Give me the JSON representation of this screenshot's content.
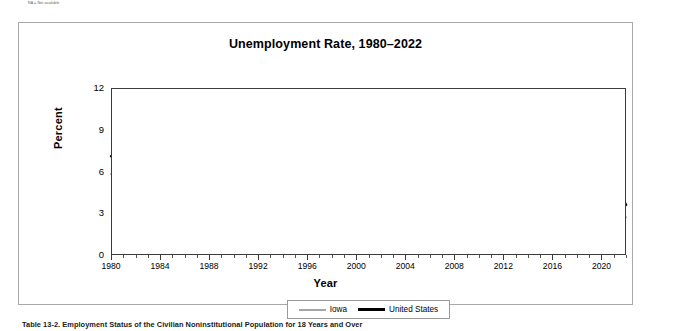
{
  "page": {
    "top_note": "NA = Not available",
    "caption": "Table 13-2.  Employment Status of the Civilian Noninstitutional Population for 18 Years and Over"
  },
  "legend": {
    "position": "bottom-center",
    "items": [
      {
        "label": "Iowa",
        "color": "#a6a6a6"
      },
      {
        "label": "United States",
        "color": "#000000"
      }
    ]
  },
  "chart_data": {
    "type": "line",
    "title": "Unemployment Rate, 1980–2022",
    "xlabel": "Year",
    "ylabel": "Percent",
    "ylim": [
      0,
      12
    ],
    "yticks": [
      0,
      3,
      6,
      9,
      12
    ],
    "xlim": [
      1980,
      2022
    ],
    "xticks": [
      1980,
      1984,
      1988,
      1992,
      1996,
      2000,
      2004,
      2008,
      2012,
      2016,
      2020
    ],
    "minor_xticks_every": 1,
    "grid": "horizontal",
    "legend_position": "bottom-center",
    "x": [
      1980,
      1981,
      1982,
      1983,
      1984,
      1985,
      1986,
      1987,
      1988,
      1989,
      1990,
      1991,
      1992,
      1993,
      1994,
      1995,
      1996,
      1997,
      1998,
      1999,
      2000,
      2001,
      2002,
      2003,
      2004,
      2005,
      2006,
      2007,
      2008,
      2009,
      2010,
      2011,
      2012,
      2013,
      2014,
      2015,
      2016,
      2017,
      2018,
      2019,
      2020,
      2021,
      2022
    ],
    "series": [
      {
        "name": "Iowa",
        "color": "#a6a6a6",
        "values": [
          5.8,
          6.6,
          8.3,
          8.1,
          7.2,
          7.8,
          7.0,
          5.5,
          4.5,
          4.2,
          4.4,
          4.5,
          4.6,
          4.0,
          3.8,
          3.5,
          3.8,
          3.3,
          2.8,
          2.5,
          2.6,
          3.3,
          4.0,
          4.4,
          4.7,
          4.4,
          3.9,
          3.8,
          4.2,
          6.3,
          6.7,
          5.9,
          5.2,
          4.7,
          4.3,
          3.8,
          3.7,
          3.1,
          2.6,
          2.8,
          5.4,
          4.1,
          2.7
        ]
      },
      {
        "name": "United States",
        "color": "#000000",
        "values": [
          7.1,
          7.6,
          9.7,
          9.6,
          7.5,
          7.2,
          7.0,
          6.2,
          5.5,
          5.3,
          5.6,
          6.8,
          7.5,
          6.9,
          6.1,
          5.6,
          5.4,
          4.9,
          4.5,
          4.2,
          4.0,
          4.7,
          5.8,
          6.0,
          5.5,
          5.1,
          4.6,
          4.6,
          5.8,
          9.3,
          9.6,
          8.9,
          8.1,
          7.4,
          6.2,
          5.3,
          4.9,
          4.4,
          3.9,
          3.7,
          8.1,
          5.3,
          3.6
        ]
      }
    ]
  }
}
